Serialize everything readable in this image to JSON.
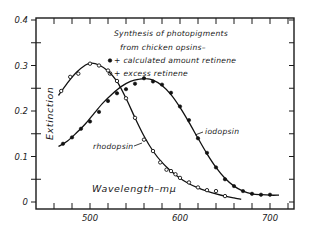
{
  "chart_data": {
    "type": "line",
    "title": "Synthesis of photopigments from chicken opsins–",
    "xlabel": "Wavelength–mμ",
    "ylabel": "Extinction",
    "xlim": [
      440,
      728
    ],
    "ylim": [
      0,
      0.4
    ],
    "x_ticks": [
      460,
      480,
      500,
      520,
      540,
      560,
      580,
      600,
      620,
      640,
      660,
      680,
      700,
      720
    ],
    "x_tick_labels": [
      {
        "value": 500,
        "label": "500"
      },
      {
        "value": 600,
        "label": "600"
      },
      {
        "value": 700,
        "label": "700"
      }
    ],
    "y_ticks": [
      0,
      0.05,
      0.1,
      0.15,
      0.2,
      0.25,
      0.3,
      0.35,
      0.4
    ],
    "y_tick_labels": [
      {
        "value": 0,
        "label": "0"
      },
      {
        "value": 0.1,
        "label": "0.1"
      },
      {
        "value": 0.2,
        "label": "0.2"
      },
      {
        "value": 0.3,
        "label": "0.3"
      },
      {
        "value": 0.4,
        "label": "0.4"
      }
    ],
    "grid": false,
    "legend": {
      "placement": "top-right",
      "heading_lines": [
        "Synthesis of photopigments",
        "from chicken opsins–"
      ],
      "entries": [
        {
          "marker": "filled-circle",
          "label": "• + calculated amount retinene"
        },
        {
          "marker": "open-circle",
          "label": "∘ + excess retinene"
        }
      ]
    },
    "series": [
      {
        "name": "rhodopsin",
        "marker": "open-circle",
        "label": "rhodopsin",
        "curve": [
          [
            465,
            0.234
          ],
          [
            475,
            0.262
          ],
          [
            485,
            0.285
          ],
          [
            495,
            0.301
          ],
          [
            502,
            0.305
          ],
          [
            510,
            0.301
          ],
          [
            520,
            0.288
          ],
          [
            530,
            0.265
          ],
          [
            540,
            0.228
          ],
          [
            550,
            0.185
          ],
          [
            560,
            0.145
          ],
          [
            570,
            0.112
          ],
          [
            580,
            0.087
          ],
          [
            590,
            0.068
          ],
          [
            600,
            0.052
          ],
          [
            610,
            0.04
          ],
          [
            620,
            0.031
          ],
          [
            630,
            0.024
          ],
          [
            640,
            0.018
          ],
          [
            650,
            0.013
          ],
          [
            660,
            0.009
          ],
          [
            668,
            0.006
          ]
        ],
        "points": [
          {
            "x": 468,
            "y": 0.244
          },
          {
            "x": 478,
            "y": 0.275
          },
          {
            "x": 487,
            "y": 0.282
          },
          {
            "x": 500,
            "y": 0.304
          },
          {
            "x": 510,
            "y": 0.3
          },
          {
            "x": 520,
            "y": 0.289
          },
          {
            "x": 530,
            "y": 0.266
          },
          {
            "x": 540,
            "y": 0.228
          },
          {
            "x": 550,
            "y": 0.185
          },
          {
            "x": 560,
            "y": 0.137
          },
          {
            "x": 570,
            "y": 0.112
          },
          {
            "x": 578,
            "y": 0.087
          },
          {
            "x": 585,
            "y": 0.071
          },
          {
            "x": 590,
            "y": 0.068
          },
          {
            "x": 595,
            "y": 0.061
          },
          {
            "x": 600,
            "y": 0.053
          },
          {
            "x": 610,
            "y": 0.043
          },
          {
            "x": 620,
            "y": 0.032
          },
          {
            "x": 630,
            "y": 0.026
          },
          {
            "x": 640,
            "y": 0.024
          },
          {
            "x": 650,
            "y": 0.013
          }
        ]
      },
      {
        "name": "iodopsin",
        "marker": "filled-circle",
        "label": "iodopsin",
        "curve": [
          [
            465,
            0.122
          ],
          [
            475,
            0.134
          ],
          [
            485,
            0.152
          ],
          [
            495,
            0.172
          ],
          [
            505,
            0.196
          ],
          [
            515,
            0.219
          ],
          [
            525,
            0.238
          ],
          [
            535,
            0.254
          ],
          [
            545,
            0.265
          ],
          [
            555,
            0.27
          ],
          [
            562,
            0.271
          ],
          [
            570,
            0.268
          ],
          [
            580,
            0.256
          ],
          [
            590,
            0.236
          ],
          [
            600,
            0.208
          ],
          [
            610,
            0.175
          ],
          [
            620,
            0.14
          ],
          [
            630,
            0.106
          ],
          [
            640,
            0.076
          ],
          [
            650,
            0.052
          ],
          [
            660,
            0.035
          ],
          [
            670,
            0.024
          ],
          [
            680,
            0.018
          ],
          [
            690,
            0.016
          ],
          [
            700,
            0.015
          ],
          [
            710,
            0.015
          ]
        ],
        "points": [
          {
            "x": 470,
            "y": 0.128
          },
          {
            "x": 480,
            "y": 0.142
          },
          {
            "x": 490,
            "y": 0.161
          },
          {
            "x": 500,
            "y": 0.177
          },
          {
            "x": 510,
            "y": 0.198
          },
          {
            "x": 520,
            "y": 0.222
          },
          {
            "x": 530,
            "y": 0.239
          },
          {
            "x": 540,
            "y": 0.248
          },
          {
            "x": 550,
            "y": 0.26
          },
          {
            "x": 560,
            "y": 0.272
          },
          {
            "x": 570,
            "y": 0.265
          },
          {
            "x": 580,
            "y": 0.258
          },
          {
            "x": 590,
            "y": 0.24
          },
          {
            "x": 600,
            "y": 0.21
          },
          {
            "x": 610,
            "y": 0.18
          },
          {
            "x": 620,
            "y": 0.14
          },
          {
            "x": 630,
            "y": 0.108
          },
          {
            "x": 640,
            "y": 0.076
          },
          {
            "x": 650,
            "y": 0.05
          },
          {
            "x": 660,
            "y": 0.035
          },
          {
            "x": 670,
            "y": 0.024
          },
          {
            "x": 680,
            "y": 0.018
          },
          {
            "x": 690,
            "y": 0.016
          },
          {
            "x": 700,
            "y": 0.016
          }
        ]
      }
    ],
    "annotations": [
      {
        "text": "rhodopsin",
        "points_to_series": "rhodopsin"
      },
      {
        "text": "iodopsin",
        "points_to_series": "iodopsin"
      }
    ]
  }
}
